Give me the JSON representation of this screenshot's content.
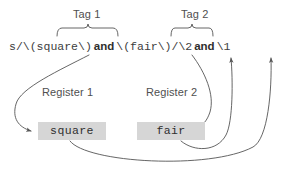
{
  "figure": {
    "background": "#ffffff",
    "stroke_color": "#555555",
    "box_fill": "#d6d6d6",
    "text_color": "#3d3d3d"
  },
  "code_line": {
    "parts": [
      {
        "kind": "mono",
        "text": "s/\\(square\\)"
      },
      {
        "kind": "word",
        "text": "and"
      },
      {
        "kind": "mono",
        "text": "\\(fair\\)/\\2"
      },
      {
        "kind": "word",
        "text": "and"
      },
      {
        "kind": "mono",
        "text": "\\1"
      }
    ],
    "full": "s/\\(square\\) and \\(fair\\)/\\2 and \\1"
  },
  "tags": [
    {
      "label": "Tag 1",
      "covers": "\\(square\\)"
    },
    {
      "label": "Tag 2",
      "covers": "\\(fair\\)"
    }
  ],
  "registers": [
    {
      "label": "Register 1",
      "value": "square"
    },
    {
      "label": "Register 2",
      "value": "fair"
    }
  ],
  "backrefs": [
    {
      "label": "\\2",
      "resolves_to": "fair"
    },
    {
      "label": "\\1",
      "resolves_to": "square"
    }
  ]
}
